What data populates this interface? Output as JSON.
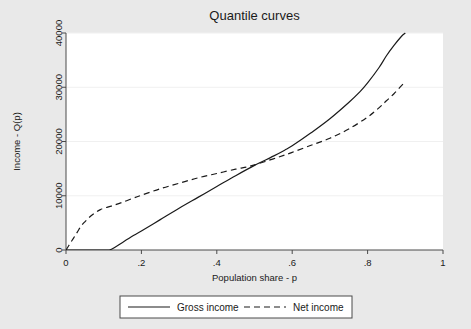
{
  "chart_data": {
    "type": "line",
    "title": "Quantile curves",
    "xlabel": "Population share - p",
    "ylabel": "Income - Q(p)",
    "xlim": [
      0,
      1
    ],
    "ylim": [
      0,
      40000
    ],
    "xticks": [
      0,
      0.2,
      0.4,
      0.6,
      0.8,
      1
    ],
    "xticklabels": [
      "0",
      ".2",
      ".4",
      ".6",
      ".8",
      "1"
    ],
    "yticks": [
      0,
      10000,
      20000,
      30000,
      40000
    ],
    "yticklabels": [
      "0",
      "10000",
      "20000",
      "30000",
      "40000"
    ],
    "grid": true,
    "grid_axis": "y",
    "legend_position": "bottom",
    "series": [
      {
        "name": "Gross income",
        "style": "solid",
        "color": "#1a1a1a",
        "x": [
          0.0,
          0.02,
          0.04,
          0.06,
          0.08,
          0.1,
          0.115,
          0.13,
          0.15,
          0.18,
          0.2,
          0.25,
          0.3,
          0.35,
          0.4,
          0.45,
          0.5,
          0.55,
          0.58,
          0.6,
          0.65,
          0.7,
          0.75,
          0.78,
          0.8,
          0.83,
          0.85,
          0.87,
          0.89,
          0.9
        ],
        "y": [
          0,
          0,
          0,
          0,
          0,
          0,
          0,
          500,
          1400,
          2700,
          3500,
          5600,
          7700,
          9700,
          11700,
          13700,
          15600,
          17300,
          18400,
          19200,
          21600,
          24200,
          27200,
          29200,
          30800,
          33600,
          35800,
          37700,
          39400,
          40000
        ]
      },
      {
        "name": "Net income",
        "style": "dashed",
        "color": "#1a1a1a",
        "x": [
          0.0,
          0.01,
          0.02,
          0.03,
          0.04,
          0.05,
          0.06,
          0.07,
          0.08,
          0.09,
          0.1,
          0.12,
          0.15,
          0.18,
          0.2,
          0.25,
          0.3,
          0.35,
          0.4,
          0.45,
          0.48,
          0.5,
          0.55,
          0.58,
          0.6,
          0.65,
          0.7,
          0.75,
          0.8,
          0.83,
          0.85,
          0.87,
          0.89,
          0.9
        ],
        "y": [
          0,
          1100,
          2200,
          3300,
          4400,
          5200,
          5900,
          6500,
          7000,
          7400,
          7700,
          8100,
          8800,
          9600,
          10100,
          11300,
          12300,
          13300,
          14100,
          14900,
          15300,
          15700,
          16800,
          17500,
          18000,
          19300,
          20600,
          22300,
          24500,
          26200,
          27500,
          28800,
          30300,
          31000
        ]
      }
    ]
  },
  "legend": {
    "entries": [
      {
        "label": "Gross income",
        "style": "solid"
      },
      {
        "label": "Net income",
        "style": "dashed"
      }
    ]
  },
  "colors": {
    "figure_background": "#e9e9e9",
    "plot_background": "#ffffff",
    "axis": "#4a4a4a",
    "gridline": "#f0f0f0",
    "ink": "#1a1a1a"
  }
}
